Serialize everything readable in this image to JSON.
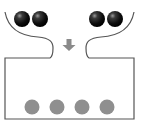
{
  "diagram": {
    "colors": {
      "outline": "#555555",
      "dark_ball": "#111111",
      "dark_ball_highlight": "#888888",
      "grey_ball": "#8f8f8f",
      "arrow": "#8a8a8a",
      "background": "#ffffff"
    },
    "top_left_balls": [
      {
        "cx": 22,
        "cy": 19,
        "r": 8
      },
      {
        "cx": 40,
        "cy": 19,
        "r": 8
      }
    ],
    "top_right_balls": [
      {
        "cx": 97,
        "cy": 19,
        "r": 8
      },
      {
        "cx": 115,
        "cy": 19,
        "r": 8
      }
    ],
    "container_balls": [
      {
        "cx": 32,
        "cy": 107,
        "r": 7.5
      },
      {
        "cx": 57,
        "cy": 107,
        "r": 7.5
      },
      {
        "cx": 82,
        "cy": 107,
        "r": 7.5
      },
      {
        "cx": 107,
        "cy": 107,
        "r": 7.5
      }
    ],
    "arrow": {
      "direction": "down",
      "x": 69,
      "y": 44
    }
  }
}
